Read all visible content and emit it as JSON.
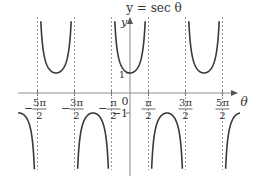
{
  "chart_data": {
    "type": "line",
    "title": "y = sec θ",
    "xlabel": "θ",
    "ylabel": "y",
    "function": "sec(theta)",
    "x_ticks": [
      "-5π/2",
      "-3π/2",
      "-π/2",
      "π/2",
      "3π/2",
      "5π/2"
    ],
    "x_tick_values": [
      -7.854,
      -4.712,
      -1.571,
      1.571,
      4.712,
      7.854
    ],
    "y_ticks": [
      "1",
      "-1"
    ],
    "y_tick_values": [
      1,
      -1
    ],
    "origin_label": "0",
    "asymptotes": [
      "-5π/2",
      "-3π/2",
      "-π/2",
      "π/2",
      "3π/2",
      "5π/2"
    ],
    "asymptote_style": "dashed",
    "grid": false,
    "legend": null,
    "series": [
      {
        "name": "sec θ",
        "branches": [
          {
            "interval": "(-3π, -5π/2)",
            "direction": "down",
            "extremum": null
          },
          {
            "interval": "(-5π/2, -3π/2)",
            "direction": "up",
            "extremum": [
              -6.283,
              1
            ]
          },
          {
            "interval": "(-3π/2, -π/2)",
            "direction": "down",
            "extremum": [
              -3.142,
              -1
            ]
          },
          {
            "interval": "(-π/2, π/2)",
            "direction": "up",
            "extremum": [
              0,
              1
            ]
          },
          {
            "interval": "(π/2, 3π/2)",
            "direction": "down",
            "extremum": [
              3.142,
              -1
            ]
          },
          {
            "interval": "(3π/2, 5π/2)",
            "direction": "up",
            "extremum": [
              6.283,
              1
            ]
          },
          {
            "interval": "(5π/2, 3π)",
            "direction": "down",
            "extremum": null
          }
        ]
      }
    ]
  },
  "labels": {
    "title": "y = sec θ",
    "y_axis": "y",
    "x_axis": "θ",
    "origin": "0",
    "y_one": "1",
    "y_minus_one": "−1",
    "ticks": [
      {
        "sign": "−",
        "num": "5π",
        "den": "2"
      },
      {
        "sign": "−",
        "num": "3π",
        "den": "2"
      },
      {
        "sign": "−",
        "num": "π",
        "den": "2"
      },
      {
        "sign": "",
        "num": "π",
        "den": "2"
      },
      {
        "sign": "",
        "num": "3π",
        "den": "2"
      },
      {
        "sign": "",
        "num": "5π",
        "den": "2"
      }
    ]
  },
  "colors": {
    "curve": "#3a3a3a",
    "axis": "#8a8a8a",
    "asymptote": "#9a9a9a",
    "text": "#333333"
  }
}
